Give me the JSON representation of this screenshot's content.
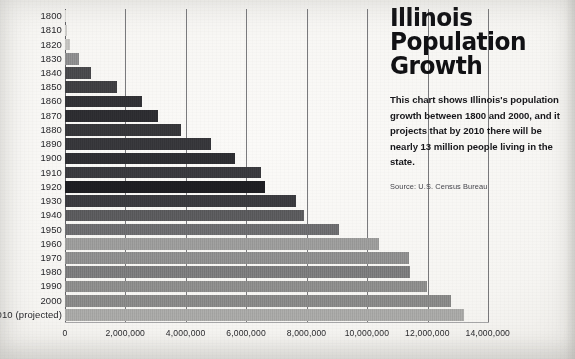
{
  "headline": {
    "title_lines": [
      "Illinois",
      "Population",
      "Growth"
    ],
    "title_line_1": "Illinois",
    "title_line_2": "Population",
    "title_line_3": "Growth",
    "blurb": "This chart shows Illinois's population growth between 1800 and 2000, and it projects that by 2010 there will be nearly 13 million people living in the state.",
    "source": "Source: U.S. Census Bureau"
  },
  "colors": {
    "page_background": "#f6f5f2",
    "gridline": "#6f6f72",
    "text": "#17171b",
    "title": "#111114"
  },
  "chart_data": {
    "type": "bar",
    "orientation": "horizontal",
    "title": "Illinois Population Growth",
    "subtitle": "This chart shows Illinois's population growth between 1800 and 2000, and it projects that by 2010 there will be nearly 13 million people living in the state.",
    "source": "Source: U.S. Census Bureau",
    "xlabel": "",
    "ylabel": "",
    "xlim": [
      0,
      14000000
    ],
    "grid": true,
    "grid_axis": "x",
    "legend": false,
    "xticks": [
      0,
      2000000,
      4000000,
      6000000,
      8000000,
      10000000,
      12000000,
      14000000
    ],
    "xticklabels": [
      "0",
      "2,000,000",
      "4,000,000",
      "6,000,000",
      "8,000,000",
      "10,000,000",
      "12,000,000",
      "14,000,000"
    ],
    "categories": [
      "1800",
      "1810",
      "1820",
      "1830",
      "1840",
      "1850",
      "1860",
      "1870",
      "1880",
      "1890",
      "1900",
      "1910",
      "1920",
      "1930",
      "1940",
      "1950",
      "1960",
      "1970",
      "1980",
      "1990",
      "2000",
      "2010 (projected)"
    ],
    "values": [
      12000,
      55000,
      157000,
      476000,
      851000,
      1712000,
      2540000,
      3078000,
      3826000,
      4822000,
      5638000,
      6485000,
      6630000,
      7631000,
      7897000,
      9070000,
      10400000,
      11400000,
      11430000,
      11970000,
      12770000,
      13200000
    ],
    "bar_colors": [
      "#d9d8d5",
      "#cfcecb",
      "#c4c3c0",
      "#8e8e8f",
      "#4a4a4d",
      "#3f3f42",
      "#313135",
      "#2d2d31",
      "#36363a",
      "#37373b",
      "#2e2e32",
      "#3a3a3e",
      "#1e1e22",
      "#3b3b3f",
      "#5b5b5e",
      "#6d6d70",
      "#9d9d9c",
      "#8f8f8f",
      "#7c7c7d",
      "#8e8e8d",
      "#8a8a89",
      "#a9a9a7"
    ]
  }
}
